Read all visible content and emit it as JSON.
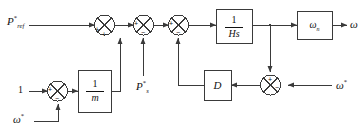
{
  "diagram": {
    "type": "control-block-diagram",
    "background_color": "#ffffff",
    "line_color": "#3a3a3a",
    "text_color": "#111111"
  },
  "inputs": {
    "p_ref": {
      "base": "P",
      "sup": "*",
      "sub": "ref"
    },
    "one": {
      "value": "1"
    },
    "omega_star_lower": {
      "base": "ω",
      "sup": "*"
    },
    "p_s": {
      "base": "P",
      "sup": "*",
      "sub": "s"
    },
    "omega_star_right": {
      "base": "ω",
      "sup": "*"
    }
  },
  "outputs": {
    "omega": {
      "base": "ω"
    }
  },
  "blocks": [
    {
      "id": "inv_m",
      "label_num": "1",
      "label_den": "m",
      "kind": "fraction"
    },
    {
      "id": "inv_Hs",
      "label_num": "1",
      "label_den": "Hs",
      "kind": "fraction"
    },
    {
      "id": "damping",
      "label": "D",
      "kind": "gain"
    },
    {
      "id": "omega_n",
      "base": "ω",
      "sub": "n",
      "kind": "gain"
    }
  ],
  "summing_junctions": [
    {
      "id": "sum_droop",
      "signs": {
        "left": "+",
        "bottom": "+"
      }
    },
    {
      "id": "sum_top1",
      "signs": {
        "left": "+",
        "bottom": "+"
      }
    },
    {
      "id": "sum_top2",
      "signs": {
        "left": "+",
        "bottom": "−"
      }
    },
    {
      "id": "sum_top3",
      "signs": {
        "left": "+",
        "bottom": "−"
      }
    },
    {
      "id": "sum_speed_err",
      "signs": {
        "top": "+",
        "right": "−"
      }
    }
  ],
  "signs": {
    "plus": "+",
    "minus": "−"
  }
}
